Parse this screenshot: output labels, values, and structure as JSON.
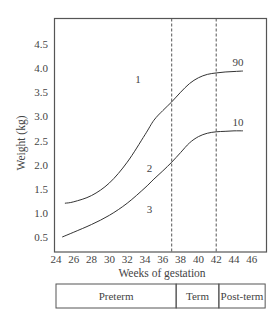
{
  "chart_data": {
    "type": "line",
    "title": "",
    "xlabel": "Weeks of gestation",
    "ylabel": "Weight (kg)",
    "xlim": [
      24,
      46
    ],
    "ylim": [
      0.2,
      4.95
    ],
    "grid": false,
    "x_ticks": [
      24,
      26,
      28,
      30,
      32,
      34,
      36,
      38,
      40,
      42,
      44,
      46
    ],
    "x_tick_labels": [
      "24",
      "26",
      "28",
      "30",
      "32",
      "34",
      "36",
      "38",
      "40",
      "42",
      "44",
      "46"
    ],
    "y_ticks": [
      0.5,
      1.0,
      1.5,
      2.0,
      2.5,
      3.0,
      3.5,
      4.0,
      4.5
    ],
    "y_tick_labels": [
      "0.5",
      "1.0",
      "1.5",
      "2.0",
      "2.5",
      "3.0",
      "3.5",
      "4.0",
      "4.5"
    ],
    "series": [
      {
        "name": "90",
        "label": "90",
        "x": [
          25,
          26,
          28,
          30,
          32,
          34,
          35,
          36,
          37,
          38,
          39,
          40,
          41,
          42,
          43,
          44,
          45
        ],
        "y": [
          1.2,
          1.23,
          1.36,
          1.62,
          2.05,
          2.62,
          2.92,
          3.12,
          3.3,
          3.5,
          3.68,
          3.8,
          3.87,
          3.9,
          3.92,
          3.93,
          3.94
        ]
      },
      {
        "name": "10",
        "label": "10",
        "x": [
          24.7,
          26,
          28,
          30,
          32,
          34,
          35,
          36,
          37,
          38,
          39,
          40,
          41,
          42,
          43,
          44,
          45
        ],
        "y": [
          0.5,
          0.6,
          0.76,
          0.95,
          1.2,
          1.52,
          1.7,
          1.87,
          2.05,
          2.25,
          2.45,
          2.58,
          2.65,
          2.68,
          2.69,
          2.7,
          2.7
        ]
      }
    ],
    "reference_lines": [
      {
        "axis": "x",
        "value": 37,
        "style": "dashed"
      },
      {
        "axis": "x",
        "value": 42,
        "style": "dashed"
      }
    ],
    "annotations": [
      {
        "text": "1",
        "x": 33.2,
        "y": 3.7
      },
      {
        "text": "2",
        "x": 34.5,
        "y": 1.85
      },
      {
        "text": "3",
        "x": 34.5,
        "y": 1.0
      }
    ],
    "periods": [
      {
        "label": "Preterm",
        "from": 24,
        "to": 37.5
      },
      {
        "label": "Term",
        "from": 37.5,
        "to": 42.3
      },
      {
        "label": "Post-term",
        "from": 42.3,
        "to": 47.5
      }
    ]
  }
}
